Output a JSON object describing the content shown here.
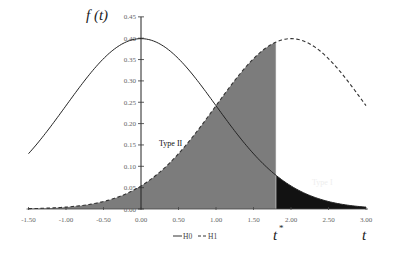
{
  "chart_data": {
    "type": "line",
    "title": "",
    "xlabel": "t",
    "ylabel": "f(t)",
    "xlim": [
      -1.5,
      3.0
    ],
    "ylim": [
      0.0,
      0.45
    ],
    "x_ticks": [
      "-1.50",
      "-1.00",
      "-0.50",
      "0.00",
      "0.50",
      "1.00",
      "1.50",
      "2.00",
      "2.50",
      "3.00"
    ],
    "y_ticks": [
      "0.45",
      "0.40",
      "0.35",
      "0.30",
      "0.25",
      "0.20",
      "0.15",
      "0.10",
      "0.05",
      "0.00"
    ],
    "grid": false,
    "legend_position": "bottom-center",
    "series": [
      {
        "name": "H0",
        "style": "solid",
        "distribution": "normal",
        "mean": 0.0,
        "sd": 1.0,
        "x": [
          -1.5,
          -1.0,
          -0.5,
          0.0,
          0.5,
          1.0,
          1.5,
          2.0,
          2.5,
          3.0
        ],
        "values": [
          0.13,
          0.242,
          0.352,
          0.399,
          0.352,
          0.242,
          0.13,
          0.054,
          0.018,
          0.004
        ]
      },
      {
        "name": "H1",
        "style": "dashed",
        "distribution": "normal",
        "mean": 2.0,
        "sd": 1.0,
        "x": [
          -1.5,
          -1.0,
          -0.5,
          0.0,
          0.5,
          1.0,
          1.5,
          2.0,
          2.5,
          3.0
        ],
        "values": [
          0.001,
          0.004,
          0.018,
          0.054,
          0.13,
          0.242,
          0.352,
          0.399,
          0.352,
          0.242
        ]
      }
    ],
    "critical_value": {
      "label": "t*",
      "x": 1.8
    },
    "regions": [
      {
        "label": "Type II",
        "description": "area under H1 left of t*",
        "color": "#7a7a7a"
      },
      {
        "label": "Type I",
        "description": "area under H0 right of t*",
        "color": "#111111"
      }
    ]
  },
  "labels": {
    "ylabel_text": "f (t)",
    "xlabel_text": "t",
    "critical_text": "t",
    "critical_sup": "*",
    "type2": "Type II",
    "type1": "Type I",
    "legend_h0": "H0",
    "legend_h1": "H1"
  },
  "colors": {
    "type2_fill": "#7c7c7c",
    "type1_fill": "#121212",
    "line": "#222222"
  }
}
